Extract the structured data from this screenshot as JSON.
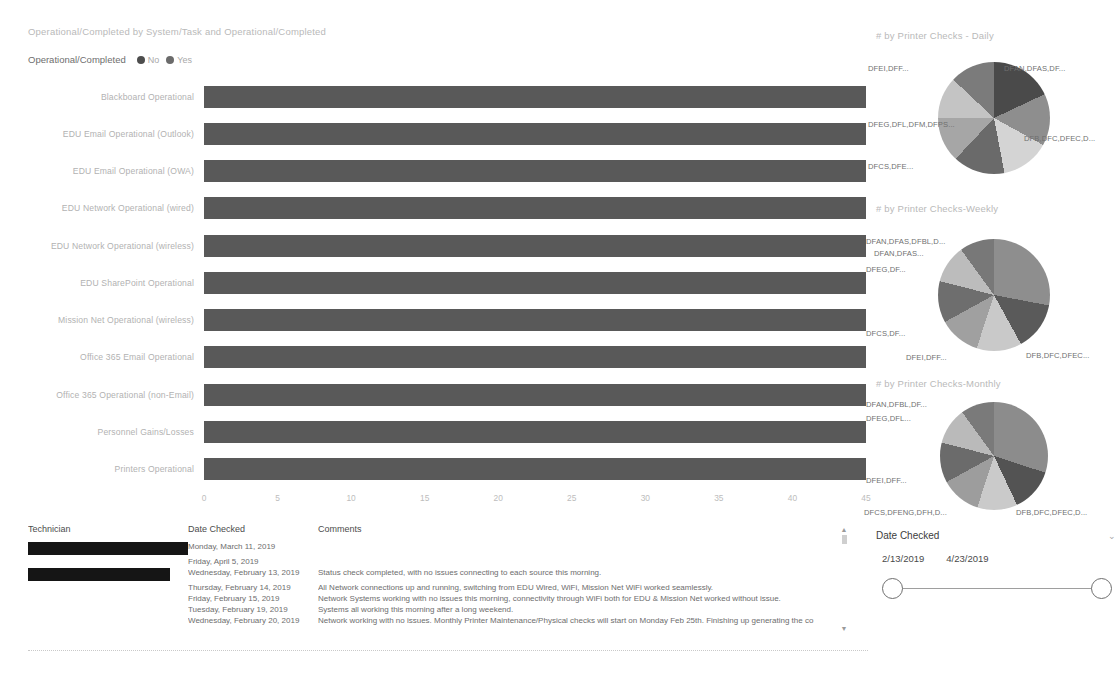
{
  "bar_chart": {
    "title": "Operational/Completed by System/Task and Operational/Completed",
    "legend": {
      "title": "Operational/Completed",
      "items": [
        {
          "label": "No",
          "color": "#4d4d4d"
        },
        {
          "label": "Yes",
          "color": "#6b6b6b"
        }
      ]
    }
  },
  "pies": [
    {
      "title": "# by Printer Checks - Daily",
      "labels": [
        "DFAN,DFAS,DF...",
        "DFB,DFC,DFEC,D...",
        "DFCS,DFE...",
        "DFEG,DFL,DFM,DFPS...",
        "DFEI,DFF..."
      ]
    },
    {
      "title": "# by Printer Checks-Weekly",
      "labels": [
        "DFAN,DFAS,DFBL,D...",
        "DFAN,DFAS...",
        "DFEG,DF...",
        "DFCS,DF...",
        "DFEI,DFF...",
        "DFB,DFC,DFEC..."
      ]
    },
    {
      "title": "# by Printer Checks-Monthly",
      "labels": [
        "DFAN,DFBL,DF...",
        "DFEG,DFL...",
        "DFEI,DFF...",
        "DFCS,DFENG,DFH,D...",
        "DFB,DFC,DFEC,D..."
      ]
    }
  ],
  "table": {
    "headers": [
      "Technician",
      "Date Checked",
      "Comments"
    ],
    "rows": [
      {
        "technician": "[redacted]",
        "redacted": true,
        "redacted_width": "full",
        "date": "Monday, March 11, 2019",
        "comment": ""
      },
      {
        "technician": "",
        "redacted": false,
        "redacted_width": "none",
        "date": "Friday, April 5, 2019",
        "comment": ""
      },
      {
        "technician": "[redacted]",
        "redacted": true,
        "redacted_width": "short",
        "date": "Wednesday, February 13, 2019",
        "comment": "Status check completed, with no issues connecting to each source this morning."
      },
      {
        "technician": "",
        "redacted": false,
        "redacted_width": "none",
        "date": "Thursday, February 14, 2019",
        "comment": "All Network connections up and running, switching from EDU Wired, WiFi, Mission Net WiFi worked seamlessly."
      },
      {
        "technician": "",
        "redacted": false,
        "redacted_width": "none",
        "date": "Friday, February 15, 2019",
        "comment": "Network Systems working with no issues this morning, connectivity through WiFi both for EDU & Mission Net worked without issue."
      },
      {
        "technician": "",
        "redacted": false,
        "redacted_width": "none",
        "date": "Tuesday, February 19, 2019",
        "comment": "Systems all working this morning after a long weekend."
      },
      {
        "technician": "",
        "redacted": false,
        "redacted_width": "none",
        "date": "Wednesday, February 20, 2019",
        "comment": "Network working with no issues. Monthly Printer Maintenance/Physical checks will start on Monday Feb 25th. Finishing up generating the co"
      }
    ],
    "scroll": {
      "up": "▲",
      "down": "▼"
    }
  },
  "date_slicer": {
    "title": "Date Checked",
    "chevron": "⌄",
    "start": "2/13/2019",
    "end": "4/23/2019"
  },
  "chart_data": {
    "type": "bar",
    "title": "Operational/Completed by System/Task and Operational/Completed",
    "orientation": "horizontal",
    "xlabel": "",
    "ylabel": "",
    "xlim": [
      0,
      45
    ],
    "xticks": [
      0,
      5,
      10,
      15,
      20,
      25,
      30,
      35,
      40,
      45
    ],
    "grid": false,
    "legend_position": "top-left",
    "categories": [
      "Blackboard Operational",
      "EDU Email Operational (Outlook)",
      "EDU Email Operational (OWA)",
      "EDU Network Operational (wired)",
      "EDU Network Operational (wireless)",
      "EDU SharePoint Operational",
      "Mission Net Operational (wireless)",
      "Office 365 Email Operational",
      "Office 365 Operational (non-Email)",
      "Personnel Gains/Losses",
      "Printers Operational"
    ],
    "series": [
      {
        "name": "Yes",
        "color": "#595959",
        "values": [
          45,
          45,
          45,
          45,
          45,
          45,
          45,
          45,
          45,
          45,
          45
        ]
      }
    ]
  },
  "pie_data": [
    {
      "type": "pie",
      "title": "# by Printer Checks - Daily",
      "labels": [
        "DFB,DFC,DFEC,D...",
        "DFCS,DFE...",
        "DFEG,DFL,DFM,DFPS...",
        "DFEI,DFF...",
        "DFAN,DFAS,DF...",
        "slice-6",
        "slice-7"
      ],
      "values": [
        18,
        15,
        14,
        15,
        13,
        12,
        13
      ],
      "colors": [
        "#4a4a4a",
        "#8e8e8e",
        "#d4d4d4",
        "#6a6a6a",
        "#a6a6a6",
        "#c4c4c4",
        "#7b7b7b"
      ]
    },
    {
      "type": "pie",
      "title": "# by Printer Checks-Weekly",
      "labels": [
        "DFAN,DFAS,DFBL,D...",
        "DFAN,DFAS...",
        "DFEG,DF...",
        "DFCS,DF...",
        "DFEI,DFF...",
        "DFB,DFC,DFEC...",
        "slice-7"
      ],
      "values": [
        28,
        14,
        13,
        12,
        12,
        11,
        10
      ],
      "colors": [
        "#8e8e8e",
        "#5a5a5a",
        "#c9c9c9",
        "#a0a0a0",
        "#6e6e6e",
        "#bcbcbc",
        "#787878"
      ]
    },
    {
      "type": "pie",
      "title": "# by Printer Checks-Monthly",
      "labels": [
        "DFAN,DFBL,DF...",
        "DFEG,DFL...",
        "DFEI,DFF...",
        "DFCS,DFENG,DFH,D...",
        "DFB,DFC,DFEC,D...",
        "slice-6",
        "slice-7"
      ],
      "values": [
        30,
        13,
        12,
        12,
        12,
        11,
        10
      ],
      "colors": [
        "#8c8c8c",
        "#535353",
        "#cacaca",
        "#9d9d9d",
        "#6b6b6b",
        "#bababa",
        "#7a7a7a"
      ]
    }
  ]
}
